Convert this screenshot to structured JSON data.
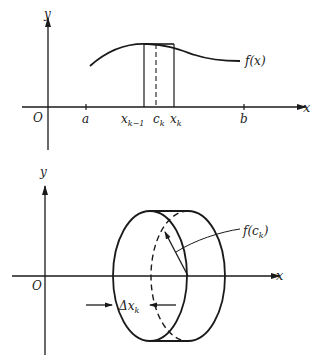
{
  "top_figure": {
    "axis_labels": {
      "y": "y",
      "x": "x",
      "origin": "O"
    },
    "tick_labels": {
      "a": "a",
      "b": "b",
      "x_km1_base": "x",
      "x_km1_sub": "k−1",
      "c_base": "c",
      "c_sub": "k",
      "x_k_base": "x",
      "x_k_sub": "k"
    },
    "function_label": "f(x)"
  },
  "bottom_figure": {
    "axis_labels": {
      "y": "y",
      "x": "x",
      "origin": "O"
    },
    "radius_label": "f(c",
    "radius_label_sub": "k",
    "radius_label_close": ")",
    "width_label_base": "Δx",
    "width_label_sub": "k"
  },
  "colors": {
    "stroke": "#1a1a1a",
    "background": "#ffffff"
  }
}
